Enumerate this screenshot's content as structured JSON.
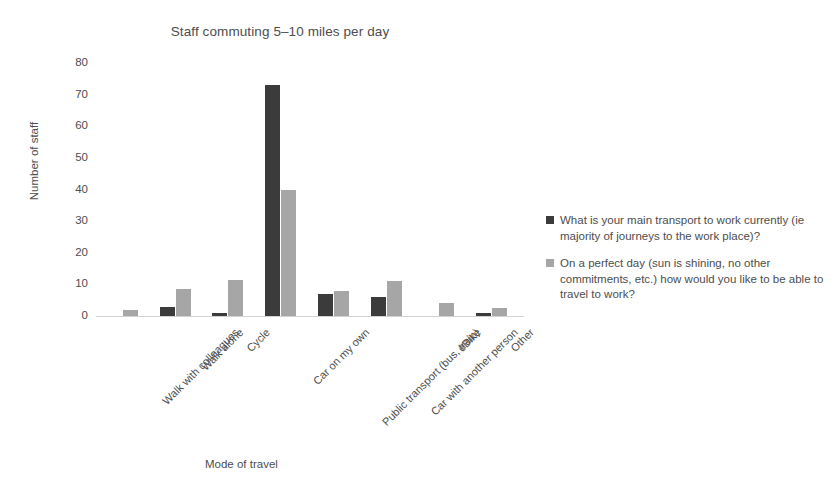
{
  "chart_data": {
    "type": "bar",
    "title": "Staff commuting 5–10 miles per day",
    "xlabel": "Mode of travel",
    "ylabel": "Number of staff",
    "ylim": [
      0,
      80
    ],
    "ytick_step": 10,
    "yticks": [
      "80",
      "70",
      "60",
      "50",
      "40",
      "30",
      "20",
      "10",
      "0"
    ],
    "grid": false,
    "legend_position": "right",
    "categories": [
      "Walk with colleagues",
      "Walk alone",
      "Cycle",
      "Car on my own",
      "Public transport (bus, train)",
      "Car with another person",
      "eBike",
      "Other"
    ],
    "series": [
      {
        "name": "What is your main transport to work currently (ie majority of journeys to the work place)?",
        "color": "#3b3b3b",
        "values": [
          0,
          3,
          1,
          73,
          7,
          6,
          0,
          1
        ]
      },
      {
        "name": "On a perfect day (sun is shining, no other commitments, etc.) how would you like to be able to travel to work?",
        "color": "#a6a6a6",
        "values": [
          2,
          8.5,
          11.5,
          40,
          8,
          11,
          4,
          2.5
        ]
      }
    ]
  },
  "legend": {
    "items": [
      {
        "label": "What is your main transport to work currently (ie majority of journeys to the work place)?",
        "color": "#3b3b3b"
      },
      {
        "label": "On a perfect day (sun is shining, no other commitments, etc.) how would you like to be able to travel to work?",
        "color": "#a6a6a6"
      }
    ]
  }
}
